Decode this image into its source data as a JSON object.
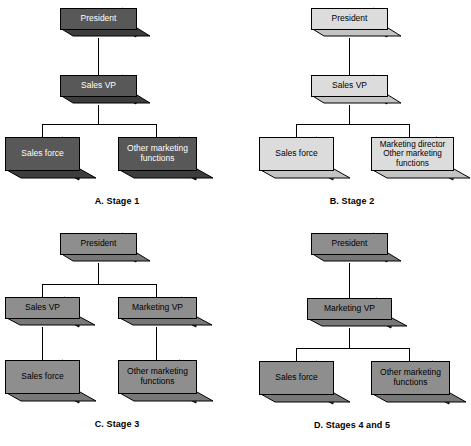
{
  "figure": {
    "kind": "organization-chart-figure",
    "panel_count": 4
  },
  "colors": {
    "dark_front": "#585858",
    "dark_side": "#2e2e2e",
    "dark_bottom": "#3d3d3d",
    "medium_front": "#8e8e8e",
    "medium_side": "#5e5e5e",
    "medium_bottom": "#787878",
    "light_front": "#dcdcdc",
    "light_side": "#9a9a9a",
    "light_bottom": "#c4c4c4",
    "outline": "#000000",
    "background": "#ffffff",
    "dark_text": "#ffffff",
    "light_text": "#000000"
  },
  "panels": [
    {
      "id": "a",
      "caption": "A. Stage 1",
      "shade": "dark",
      "nodes": {
        "president": "President",
        "sales_vp": "Sales VP",
        "sales_force": "Sales force",
        "other_marketing": "Other marketing\nfunctions"
      }
    },
    {
      "id": "b",
      "caption": "B. Stage 2",
      "shade": "light",
      "nodes": {
        "president": "President",
        "sales_vp": "Sales VP",
        "sales_force": "Sales force",
        "marketing_director": "Marketing director\nOther marketing\nfunctions"
      }
    },
    {
      "id": "c",
      "caption": "C. Stage 3",
      "shade": "medium",
      "nodes": {
        "president": "President",
        "sales_vp": "Sales VP",
        "marketing_vp": "Marketing VP",
        "sales_force": "Sales force",
        "other_marketing": "Other marketing\nfunctions"
      }
    },
    {
      "id": "d",
      "caption": "D. Stages 4 and 5",
      "shade": "medium",
      "nodes": {
        "president": "President",
        "marketing_vp": "Marketing VP",
        "sales_force": "Sales force",
        "other_marketing": "Other marketing\nfunctions"
      }
    }
  ]
}
